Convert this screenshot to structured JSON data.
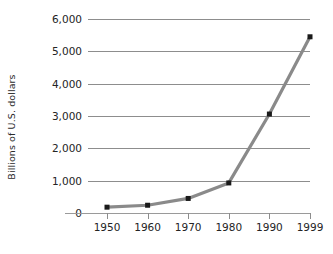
{
  "chart_data": {
    "type": "line",
    "title": "",
    "xlabel": "",
    "ylabel": "Billions of U.S. dollars",
    "categories": [
      "1950",
      "1960",
      "1970",
      "1980",
      "1990",
      "1999"
    ],
    "values": [
      180,
      240,
      450,
      930,
      3060,
      5450
    ],
    "series": [
      {
        "name": "Billions of U.S. dollars",
        "values": [
          180,
          240,
          450,
          930,
          3060,
          5450
        ]
      }
    ],
    "ylim": [
      0,
      6000
    ],
    "y_ticks": [
      0,
      1000,
      2000,
      3000,
      4000,
      5000,
      6000
    ],
    "y_tick_labels": [
      "0",
      "1,000",
      "2,000",
      "3,000",
      "4,000",
      "5,000",
      "6,000"
    ],
    "x_tick_labels": [
      "1950",
      "1960",
      "1970",
      "1980",
      "1990",
      "1999"
    ],
    "grid": "horizontal",
    "legend": "none",
    "colors": {
      "line": "#8a8a8a",
      "marker": "#1a1a1a",
      "gridline": "#8d8d8d",
      "axis": "#9a9a9a",
      "text": "#242424",
      "background": "#ffffff"
    }
  }
}
